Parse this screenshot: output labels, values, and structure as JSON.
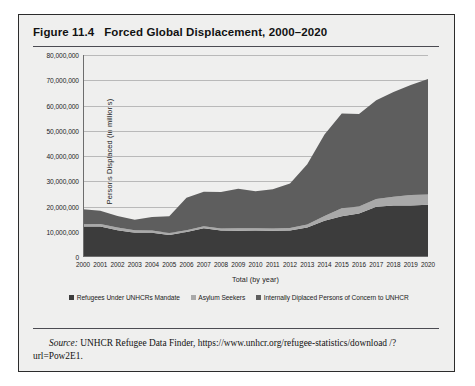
{
  "figure": {
    "number": "Figure 11.4",
    "title": "Forced Global Displacement, 2000–2020"
  },
  "source": {
    "label": "Source:",
    "text": " UNHCR Refugee Data Finder, https://www.unhcr.org/refugee-statistics/download /?url=Pow2E1."
  },
  "chart_data": {
    "type": "area",
    "stacked": true,
    "title": "Forced Global Displacement, 2000–2020",
    "xlabel": "Total (by year)",
    "ylabel": "Persons Displaced (in millions)",
    "ylim": [
      0,
      80000000
    ],
    "ytick_step": 10000000,
    "grid": true,
    "legend_position": "bottom",
    "categories": [
      "2000",
      "2001",
      "2002",
      "2003",
      "2004",
      "2005",
      "2006",
      "2007",
      "2008",
      "2009",
      "2010",
      "2011",
      "2012",
      "2013",
      "2014",
      "2015",
      "2016",
      "2017",
      "2018",
      "2019",
      "2020"
    ],
    "ytick_labels": [
      "0",
      "10,000,000",
      "20,000,000",
      "30,000,000",
      "40,000,000",
      "50,000,000",
      "60,000,000",
      "70,000,000",
      "80,000,000"
    ],
    "series": [
      {
        "name": "Refugees Under UNHCRs Mandate",
        "color": "#3c3c3c",
        "values": [
          12100000,
          12100000,
          10600000,
          9600000,
          9600000,
          8700000,
          9900000,
          11400000,
          10500000,
          10400000,
          10500000,
          10400000,
          10500000,
          11700000,
          14400000,
          16100000,
          17200000,
          19900000,
          20400000,
          20400000,
          20700000
        ]
      },
      {
        "name": "Asylum Seekers",
        "color": "#a9a9a9",
        "values": [
          900000,
          940000,
          1050000,
          1000000,
          890000,
          800000,
          740000,
          740000,
          830000,
          1000000,
          840000,
          900000,
          940000,
          1170000,
          1800000,
          3200000,
          2800000,
          3100000,
          3500000,
          4200000,
          4100000
        ]
      },
      {
        "name": "Internally Diplaced Persons of Concern to UNHCR",
        "color": "#5e5e5e",
        "values": [
          5900000,
          5300000,
          4600000,
          4200000,
          5400000,
          6600000,
          12800000,
          13700000,
          14400000,
          15600000,
          14700000,
          15500000,
          17700000,
          23900000,
          32300000,
          37500000,
          36600000,
          39100000,
          41400000,
          43500000,
          45700000
        ]
      }
    ],
    "totals": [
      18900000,
      18340000,
      16250000,
      14800000,
      15890000,
      16100000,
      23440000,
      25840000,
      25730000,
      27000000,
      26040000,
      26800000,
      29140000,
      36770000,
      48500000,
      56800000,
      56600000,
      62100000,
      65300000,
      68100000,
      70500000
    ]
  },
  "legend": {
    "items": [
      {
        "label": "Refugees Under UNHCRs Mandate",
        "color": "#3c3c3c"
      },
      {
        "label": "Asylum Seekers",
        "color": "#a9a9a9"
      },
      {
        "label": "Internally Diplaced Persons of Concern to UNHCR",
        "color": "#5e5e5e"
      }
    ]
  }
}
